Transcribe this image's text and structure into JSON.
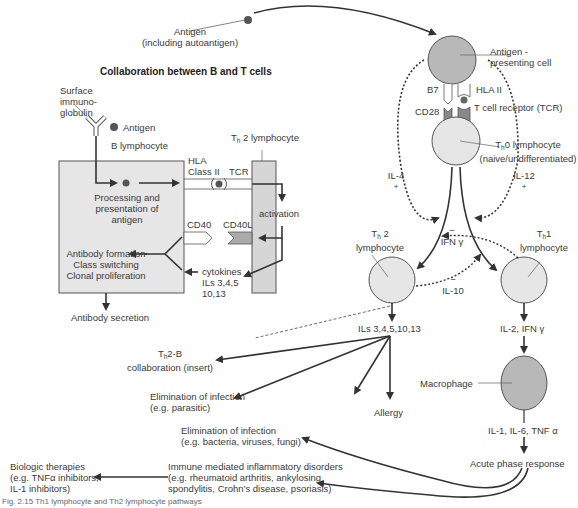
{
  "title": "Collaboration between B and T cells",
  "caption": "Fig. 2.15 Th1 lymphocyte and Th2 lymphocyte pathways",
  "antigen_top": {
    "line1": "Antigen",
    "line2": "(including autoantigen)"
  },
  "apc": {
    "label1": "Antigen -",
    "label2": "presenting cell",
    "b7": "B7",
    "hla": "HLA II",
    "cd28": "CD28",
    "tcr": "T cell receptor (TCR)"
  },
  "th0": {
    "prefix": "T",
    "sub": "h",
    "label1": "0 lymphocyte",
    "label2": "(naive/undifferentiated)"
  },
  "il4": "IL-4",
  "il12": "IL-12",
  "plus": "+",
  "minus": "−",
  "ifn": "IFN γ",
  "il10": "IL-10",
  "th2": {
    "prefix": "T",
    "sub": "h",
    "num": " 2",
    "label": "lymphocyte"
  },
  "th1": {
    "prefix": "T",
    "sub": "h",
    "num": "1",
    "label": "lymphocyte"
  },
  "th2_output": "ILs 3,4,5,10,13",
  "th1_output": "IL-2, IFN γ",
  "macrophage": "Macrophage",
  "mac_output": "IL-1, IL-6, TNF α",
  "acute": "Acute phase response",
  "th2b": {
    "prefix": "T",
    "sub": "h",
    "line1": "2-B",
    "line2": "collaboration (insert)"
  },
  "elim_parasitic": {
    "line1": "Elimination of infection",
    "line2": "(e.g. parasitic)"
  },
  "allergy": "Allergy",
  "elim_bacteria": {
    "line1": "Elimination of infection",
    "line2": "(e.g. bacteria, viruses, fungi)"
  },
  "imid": {
    "line1": "Immune mediated inflammatory disorders",
    "line2": "(e.g. rheumatoid arthritis, ankylosing",
    "line3": "spondylitis, Crohn’s disease, psoriasis)"
  },
  "biologic": {
    "line1": "Biologic therapies",
    "line2": "(e.g. TNFα inhibitors,",
    "line3": "IL-1 inhibitors)"
  },
  "insert": {
    "surface_ig1": "Surface",
    "surface_ig2": "immuno-",
    "surface_ig3": "globulin",
    "antigen": "Antigen",
    "b_lymph": "B lymphocyte",
    "th2_lymph_prefix": "T",
    "th2_lymph_sub": "h",
    "th2_lymph": " 2 lymphocyte",
    "hla1": "HLA",
    "hla2": "Class II",
    "tcr": "TCR",
    "processing1": "Processing and",
    "processing2": "presentation of",
    "processing3": "antigen",
    "activation": "activation",
    "cd40": "CD40",
    "cd40l": "CD40L",
    "ab1": "Antibody formation",
    "ab2": "Class switching",
    "ab3": "Clonal proliferation",
    "cyt1": "cytokines",
    "cyt2": "ILs 3,4,5",
    "cyt3": "10,13",
    "secretion": "Antibody secretion"
  },
  "colors": {
    "cell_dark": "#b8b8b8",
    "cell_light": "#e6e6e6",
    "line": "#333333"
  }
}
